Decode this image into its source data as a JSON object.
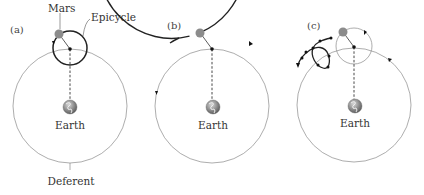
{
  "panels": [
    {
      "id": "a",
      "label": "(a)",
      "labels": {
        "planet": "Mars",
        "epicycle": "Epicycle",
        "earth": "Earth",
        "deferent": "Deferent"
      }
    },
    {
      "id": "b",
      "label": "(b)",
      "labels": {
        "earth": "Earth"
      }
    },
    {
      "id": "c",
      "label": "(c)",
      "labels": {
        "earth": "Earth"
      }
    }
  ],
  "colors": {
    "thin_line": "#8a8a8a",
    "thick_line": "#222222",
    "planet": "#8c8c8c",
    "earth_land": "#9a9a9a",
    "earth_ocean": "#5e5e5e"
  }
}
